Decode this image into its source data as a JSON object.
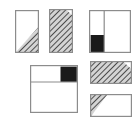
{
  "image": {
    "title": "Hatched and filled rectangle diagram set",
    "background_color": "#ffffff",
    "width": 137,
    "height": 127
  },
  "style": {
    "outline_color": "#8c8c8c",
    "outline_width": 1.2,
    "hatch_line_color": "#4d4d4d",
    "hatch_background_color": "#d4d4d4",
    "fill_black": "#1a1a1a",
    "fill_white": "#ffffff",
    "divider_color": "#8c8c8c"
  },
  "figures": [
    {
      "id": "figure-1",
      "label": "Tall rectangle, hatched lower-right triangle",
      "shape": "portrait-rectangle",
      "outline": true,
      "regions": [
        {
          "name": "upper-left-triangle",
          "fill": "white"
        },
        {
          "name": "lower-right-triangle",
          "fill": "hatch"
        }
      ],
      "diagonal": "bottom-left-to-top-right",
      "hatched_fraction": 0.5
    },
    {
      "id": "figure-2",
      "label": "Tall rectangle, fully hatched with white corner notch",
      "shape": "portrait-rectangle",
      "outline": true,
      "regions": [
        {
          "name": "main-body",
          "fill": "hatch"
        },
        {
          "name": "top-right-corner-notch",
          "fill": "white"
        }
      ],
      "diagonal": "top-right-corner-cut",
      "hatched_fraction": 0.94
    },
    {
      "id": "figure-3",
      "label": "Square split by vertical divider with black block at lower left",
      "shape": "square",
      "outline": true,
      "regions": [
        {
          "name": "left-column-top",
          "fill": "white"
        },
        {
          "name": "left-column-bottom-block",
          "fill": "black"
        },
        {
          "name": "right-column",
          "fill": "white"
        }
      ],
      "dividers": [
        {
          "orientation": "vertical",
          "position": 0.36
        }
      ],
      "black_fraction": 0.17
    },
    {
      "id": "figure-4",
      "label": "Square split by horizontal divider with black block at upper right",
      "shape": "square",
      "outline": true,
      "regions": [
        {
          "name": "top-row-left",
          "fill": "white"
        },
        {
          "name": "top-row-right-block",
          "fill": "black"
        },
        {
          "name": "bottom-row",
          "fill": "white"
        }
      ],
      "dividers": [
        {
          "orientation": "horizontal",
          "position": 0.35
        }
      ],
      "black_fraction": 0.12
    },
    {
      "id": "figure-5",
      "label": "Wide rectangle, fully hatched with white corner notch",
      "shape": "landscape-rectangle",
      "outline": true,
      "regions": [
        {
          "name": "main-body",
          "fill": "hatch"
        },
        {
          "name": "top-right-corner-notch",
          "fill": "white"
        }
      ],
      "diagonal": "top-right-corner-cut",
      "hatched_fraction": 0.93
    },
    {
      "id": "figure-6",
      "label": "Wide rectangle, hatched left triangle",
      "shape": "landscape-rectangle",
      "outline": true,
      "regions": [
        {
          "name": "left-triangle",
          "fill": "hatch"
        },
        {
          "name": "right-region",
          "fill": "white"
        }
      ],
      "diagonal": "top-left-to-bottom-left-wedge",
      "hatched_fraction": 0.3
    }
  ]
}
